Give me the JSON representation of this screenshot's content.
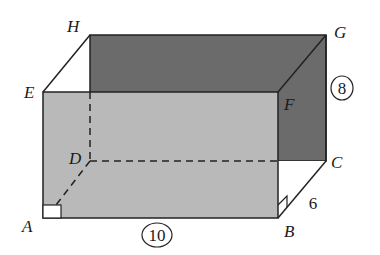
{
  "figure": {
    "type": "rectangular-prism",
    "colors": {
      "back_face": "#6b6b6b",
      "front_face": "#b9b9b9",
      "edge": "#222222",
      "background": "#ffffff"
    },
    "vertices": {
      "A": {
        "label": "A",
        "x": 43,
        "y": 218
      },
      "B": {
        "label": "B",
        "x": 278,
        "y": 218
      },
      "C": {
        "label": "C",
        "x": 326,
        "y": 161
      },
      "D": {
        "label": "D",
        "x": 90,
        "y": 161
      },
      "E": {
        "label": "E",
        "x": 43,
        "y": 92
      },
      "F": {
        "label": "F",
        "x": 278,
        "y": 92
      },
      "G": {
        "label": "G",
        "x": 326,
        "y": 35
      },
      "H": {
        "label": "H",
        "x": 90,
        "y": 35
      }
    },
    "dimensions": {
      "length": {
        "value": "10",
        "circled": true,
        "edge": "AB"
      },
      "height": {
        "value": "8",
        "circled": true,
        "edge": "GC"
      },
      "width": {
        "value": "6",
        "circled": false,
        "edge": "BC"
      }
    },
    "right_angle_markers": [
      "A",
      "B"
    ],
    "hidden_edges": [
      "HD",
      "DC",
      "DA"
    ]
  }
}
